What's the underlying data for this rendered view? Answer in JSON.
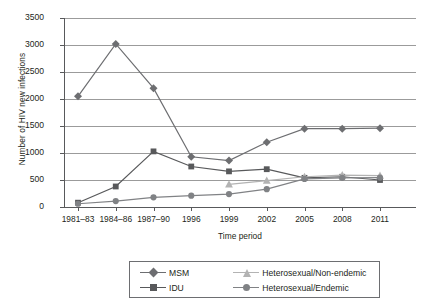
{
  "chart_data": {
    "type": "line",
    "title": "",
    "xlabel": "Time period",
    "ylabel": "Number of HIV new infections",
    "categories": [
      "1981–83",
      "1984–86",
      "1987–90",
      "1996",
      "1999",
      "2002",
      "2005",
      "2008",
      "2011"
    ],
    "ylim": [
      0,
      3500
    ],
    "yticks": [
      0,
      500,
      1000,
      1500,
      2000,
      2500,
      3000,
      3500
    ],
    "grid": true,
    "legend_position": "bottom",
    "series": [
      {
        "name": "MSM",
        "marker": "diamond",
        "color": "#6d6e71",
        "values": [
          2050,
          3020,
          2200,
          930,
          860,
          1200,
          1450,
          1450,
          1460
        ]
      },
      {
        "name": "IDU",
        "marker": "square",
        "color": "#58595b",
        "values": [
          80,
          380,
          1030,
          750,
          660,
          700,
          540,
          560,
          500
        ]
      },
      {
        "name": "Heterosexual/Non-endemic",
        "marker": "triangle",
        "color": "#b3b3b3",
        "values": [
          null,
          null,
          null,
          null,
          420,
          490,
          560,
          590,
          580
        ]
      },
      {
        "name": "Heterosexual/Endemic",
        "marker": "circle",
        "color": "#808285",
        "values": [
          60,
          110,
          180,
          210,
          240,
          330,
          520,
          540,
          545
        ]
      }
    ]
  },
  "legend": {
    "entries": [
      {
        "label": "MSM",
        "marker": "diamond-marker",
        "color": "#6d6e71"
      },
      {
        "label": "Heterosexual/Non-endemic",
        "marker": "triangle-marker",
        "color": "#b3b3b3"
      },
      {
        "label": "IDU",
        "marker": "square-marker",
        "color": "#58595b"
      },
      {
        "label": "Heterosexual/Endemic",
        "marker": "circle-marker",
        "color": "#808285"
      }
    ]
  },
  "axes": {
    "y_title": "Number of HIV new infections",
    "x_title": "Time period",
    "y_tick_labels": [
      "3500",
      "3000",
      "2500",
      "2000",
      "1500",
      "1000",
      "500",
      "0"
    ],
    "x_tick_labels": [
      "1981–83",
      "1984–86",
      "1987–90",
      "1996",
      "1999",
      "2002",
      "2005",
      "2008",
      "2011"
    ]
  },
  "colors": {
    "grid": "#9b9b9b",
    "axis": "#58595b",
    "text": "#231f20",
    "background": "#ffffff"
  }
}
